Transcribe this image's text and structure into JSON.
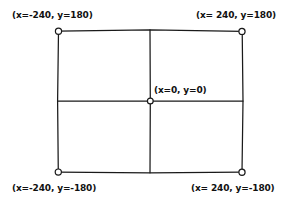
{
  "diagram": {
    "type": "coordinate-rectangle",
    "stroke_color": "#1a1a1a",
    "background_color": "#ffffff",
    "marker_fill": "#ffffff",
    "labels": {
      "top_left": "(x=-240, y=180)",
      "top_right": "(x= 240, y=180)",
      "center": "(x=0, y=0)",
      "bottom_left": "(x=-240, y=-180)",
      "bottom_right": "(x= 240, y=-180)"
    },
    "points": [
      {
        "name": "top-left",
        "x": -240,
        "y": 180,
        "px": 58,
        "py": 31
      },
      {
        "name": "top-right",
        "x": 240,
        "y": 180,
        "px": 242,
        "py": 31
      },
      {
        "name": "center",
        "x": 0,
        "y": 0,
        "px": 150,
        "py": 101
      },
      {
        "name": "bottom-left",
        "x": -240,
        "y": -180,
        "px": 58,
        "py": 172
      },
      {
        "name": "bottom-right",
        "x": 240,
        "y": -180,
        "px": 242,
        "py": 172
      }
    ],
    "axis_ranges": {
      "x_min": -240,
      "x_max": 240,
      "y_min": -180,
      "y_max": 180
    }
  }
}
